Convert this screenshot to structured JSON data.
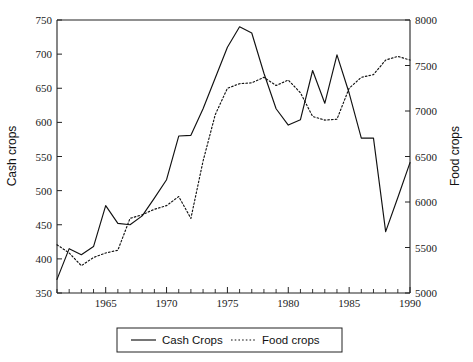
{
  "chart_data": {
    "type": "line",
    "title": "",
    "xlabel": "",
    "ylabel": "Cash crops",
    "y2label": "Food crops",
    "grid": false,
    "legend_position": "bottom-center",
    "xlim": [
      1961,
      1990
    ],
    "ylim": [
      350,
      750
    ],
    "y2lim": [
      5000,
      8000
    ],
    "x_ticks_major": [
      1965,
      1970,
      1975,
      1980,
      1985,
      1990
    ],
    "x_ticks_minor_step": 1,
    "y_ticks": [
      350,
      400,
      450,
      500,
      550,
      600,
      650,
      700,
      750
    ],
    "y2_ticks": [
      5000,
      5500,
      6000,
      6500,
      7000,
      7500,
      8000
    ],
    "x": [
      1961,
      1962,
      1963,
      1964,
      1965,
      1966,
      1967,
      1968,
      1969,
      1970,
      1971,
      1972,
      1973,
      1974,
      1975,
      1976,
      1977,
      1978,
      1979,
      1980,
      1981,
      1982,
      1983,
      1984,
      1985,
      1986,
      1987,
      1988,
      1989,
      1990
    ],
    "series": [
      {
        "name": "Cash Crops",
        "axis": "left",
        "style": "solid",
        "units": "Cash crops",
        "values": [
          370,
          415,
          406,
          418,
          478,
          452,
          450,
          463,
          489,
          516,
          580,
          581,
          620,
          665,
          710,
          740,
          731,
          672,
          620,
          596,
          604,
          676,
          628,
          699,
          643,
          577,
          577,
          440,
          490,
          541
        ]
      },
      {
        "name": "Food crops",
        "axis": "right",
        "style": "dotted",
        "units": "Food crops",
        "values": [
          5530,
          5440,
          5300,
          5390,
          5440,
          5470,
          5820,
          5860,
          5920,
          5960,
          6060,
          5820,
          6450,
          6960,
          7250,
          7300,
          7310,
          7370,
          7280,
          7340,
          7200,
          6940,
          6900,
          6910,
          7250,
          7370,
          7400,
          7560,
          7600,
          7560
        ]
      }
    ]
  },
  "axes": {
    "left": {
      "title": "Cash crops",
      "tick_labels": [
        "750",
        "700",
        "650",
        "600",
        "550",
        "500",
        "450",
        "400",
        "350"
      ]
    },
    "right": {
      "title": "Food crops",
      "tick_labels": [
        "8000",
        "7500",
        "7000",
        "6500",
        "6000",
        "5500",
        "5000"
      ]
    },
    "bottom": {
      "tick_labels": [
        "1965",
        "1970",
        "1975",
        "1980",
        "1985",
        "1990"
      ]
    }
  },
  "legend": {
    "items": [
      {
        "label": "Cash Crops",
        "style": "solid"
      },
      {
        "label": "Food crops",
        "style": "dotted"
      }
    ]
  },
  "colors": {
    "ink": "#111111",
    "axis": "#222222",
    "background": "#ffffff"
  }
}
